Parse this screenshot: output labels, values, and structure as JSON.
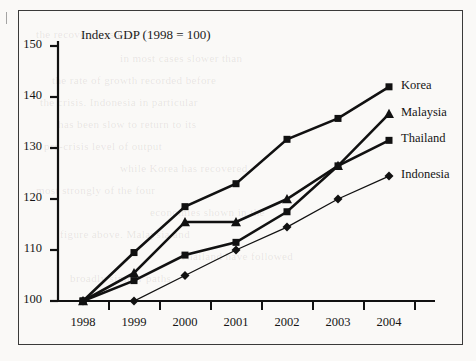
{
  "chart_data": {
    "type": "line",
    "title": "Index GDP (1998 = 100)",
    "xlabel": "",
    "ylabel": "",
    "categories": [
      "1998",
      "1999",
      "2000",
      "2001",
      "2002",
      "2003",
      "2004"
    ],
    "xlim": [
      1998,
      2004
    ],
    "ylim": [
      100,
      150
    ],
    "yticks": [
      100,
      110,
      120,
      130,
      140,
      150
    ],
    "grid": false,
    "legend_position": "right-inline-at-line-ends",
    "series": [
      {
        "name": "Korea",
        "marker": "square",
        "values": [
          100,
          109.5,
          118.5,
          123,
          131.7,
          135.8,
          142
        ]
      },
      {
        "name": "Malaysia",
        "marker": "triangle",
        "values": [
          100,
          105.5,
          115.5,
          115.5,
          120,
          126.5,
          136.7
        ]
      },
      {
        "name": "Thailand",
        "marker": "square",
        "values": [
          100,
          104,
          109,
          111.5,
          117.5,
          126.5,
          131.5
        ]
      },
      {
        "name": "Indonesia",
        "marker": "diamond",
        "values": [
          100,
          100,
          105,
          110,
          114.5,
          120,
          124.5
        ]
      }
    ]
  },
  "figure": {
    "border_color": "#3a3a3a",
    "ink_color": "#111111",
    "background": "#faf9f7"
  },
  "bleed_text": [
    {
      "text": "the recovery has been",
      "x": 36,
      "y": 28
    },
    {
      "text": "in most cases slower than",
      "x": 120,
      "y": 52
    },
    {
      "text": "the rate of growth recorded before",
      "x": 52,
      "y": 74
    },
    {
      "text": "the crisis. Indonesia in particular",
      "x": 40,
      "y": 96
    },
    {
      "text": "has been slow to return to its",
      "x": 58,
      "y": 118
    },
    {
      "text": "pre-crisis level of output",
      "x": 44,
      "y": 140
    },
    {
      "text": "while Korea has recovered",
      "x": 120,
      "y": 162
    },
    {
      "text": "most strongly of the four",
      "x": 36,
      "y": 184
    },
    {
      "text": "economies shown in the",
      "x": 150,
      "y": 206
    },
    {
      "text": "figure above. Malaysia and",
      "x": 60,
      "y": 228
    },
    {
      "text": "Thailand have followed",
      "x": 180,
      "y": 250
    },
    {
      "text": "broadly similar paths",
      "x": 70,
      "y": 272
    }
  ]
}
